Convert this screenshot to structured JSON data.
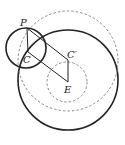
{
  "diagram": {
    "title": "",
    "colors": {
      "stroke": "#222222",
      "dashed": "#888888",
      "background": "#ffffff"
    },
    "points": {
      "P": {
        "label": "P",
        "x": 27,
        "y": 28
      },
      "C": {
        "label": "C",
        "x": 28,
        "y": 52
      },
      "C_prime": {
        "label": "C′",
        "x": 68,
        "y": 60
      },
      "E": {
        "label": "E",
        "x": 68,
        "y": 82
      }
    },
    "circles": [
      {
        "name": "small-solid-circle",
        "cx": 26,
        "cy": 48,
        "r": 20,
        "style": "solid"
      },
      {
        "name": "large-solid-circle",
        "cx": 68,
        "cy": 80,
        "r": 50,
        "style": "solid"
      },
      {
        "name": "large-dashed-circle",
        "cx": 68,
        "cy": 61,
        "r": 50,
        "style": "dashed"
      },
      {
        "name": "small-dashed-circle",
        "cx": 67,
        "cy": 82,
        "r": 20,
        "style": "dashed"
      }
    ],
    "segments": [
      {
        "name": "segment-P-C",
        "from": "P",
        "to": "C"
      },
      {
        "name": "segment-P-Cprime",
        "from": "P",
        "to": "C_prime"
      },
      {
        "name": "segment-C-E",
        "from": "C",
        "to": "E"
      },
      {
        "name": "segment-Cprime-E",
        "from": "C_prime",
        "to": "E"
      }
    ]
  }
}
